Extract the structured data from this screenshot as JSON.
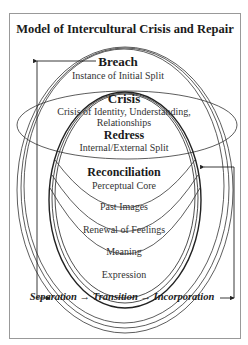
{
  "title": "Model of Intercultural Crisis and Repair",
  "stages": {
    "breach": {
      "heading": "Breach",
      "sub": "Instance of Initial Split"
    },
    "crisis": {
      "heading": "Crisis",
      "sub_line1": "Crisis of Identity, Understanding,",
      "sub_line2": "Relationships"
    },
    "redress": {
      "heading": "Redress",
      "sub": "Internal/External Split"
    },
    "reconciliation": {
      "heading": "Reconciliation",
      "sub": "Perceptual Core"
    }
  },
  "layers": [
    "Past Images",
    "Renewal of Feelings",
    "Meaning",
    "Expression"
  ],
  "flow": "Separation → Transition → Incorporation",
  "colors": {
    "line": "#333333",
    "frame": "#999999",
    "text": "#1a1a1a"
  }
}
